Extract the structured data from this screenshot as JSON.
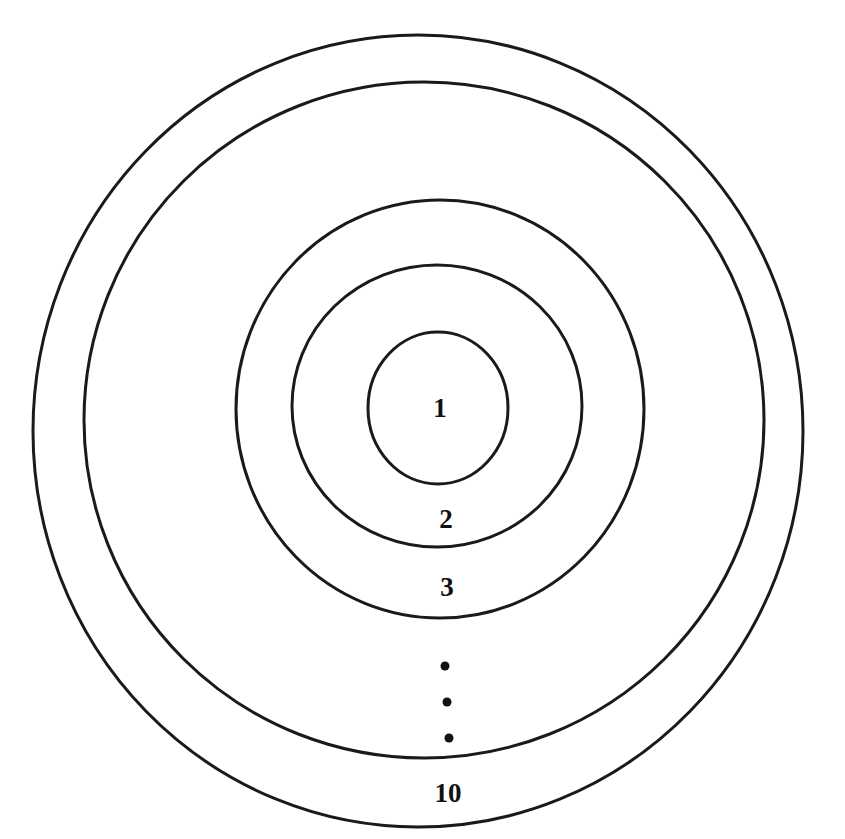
{
  "diagram": {
    "stroke_color": "#1a1a1a",
    "text_color": "#111111",
    "background": "#ffffff",
    "rings": [
      {
        "id": "ring-1",
        "cx": 438,
        "cy": 408,
        "rx": 70,
        "ry": 76
      },
      {
        "id": "ring-2",
        "cx": 437,
        "cy": 406,
        "rx": 145,
        "ry": 141
      },
      {
        "id": "ring-3",
        "cx": 440,
        "cy": 409,
        "rx": 204,
        "ry": 209
      },
      {
        "id": "ring-4",
        "cx": 424,
        "cy": 420,
        "rx": 340,
        "ry": 338
      },
      {
        "id": "ring-5",
        "cx": 418,
        "cy": 431,
        "rx": 385,
        "ry": 396
      }
    ],
    "labels": [
      {
        "id": "label-1",
        "text": "1",
        "x": 440,
        "y": 408
      },
      {
        "id": "label-2",
        "text": "2",
        "x": 446,
        "y": 519
      },
      {
        "id": "label-3",
        "text": "3",
        "x": 447,
        "y": 587
      },
      {
        "id": "label-10",
        "text": "10",
        "x": 448,
        "y": 793
      }
    ],
    "ellipsis_dots": [
      {
        "x": 445,
        "y": 666,
        "r": 4.5
      },
      {
        "x": 447,
        "y": 702,
        "r": 4.5
      },
      {
        "x": 449,
        "y": 738,
        "r": 4.5
      }
    ]
  }
}
